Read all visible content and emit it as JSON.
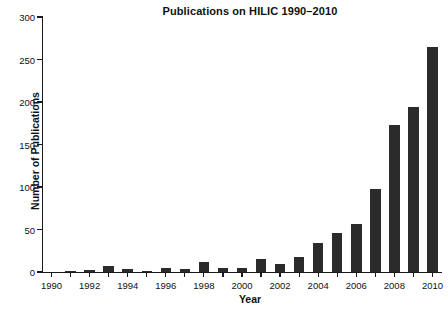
{
  "chart_data": {
    "type": "bar",
    "title": "Publications on HILIC 1990–2010",
    "xlabel": "Year",
    "ylabel": "Number of Publications",
    "categories": [
      "1990",
      "1991",
      "1992",
      "1993",
      "1994",
      "1995",
      "1996",
      "1997",
      "1998",
      "1999",
      "2000",
      "2001",
      "2002",
      "2003",
      "2004",
      "2005",
      "2006",
      "2007",
      "2008",
      "2009",
      "2010"
    ],
    "values": [
      0,
      1,
      2,
      7,
      4,
      1,
      5,
      4,
      12,
      5,
      5,
      15,
      9,
      18,
      34,
      46,
      57,
      98,
      173,
      194,
      265
    ],
    "xlim": [
      1989.5,
      2010.5
    ],
    "ylim": [
      0,
      300
    ],
    "ytick_values": [
      0,
      50,
      100,
      150,
      200,
      250,
      300
    ],
    "ytick_labels": [
      "0",
      "50",
      "100",
      "150",
      "200",
      "250",
      "300"
    ],
    "xtick_labels_visible": [
      "1990",
      "1992",
      "1994",
      "1996",
      "1998",
      "2000",
      "2002",
      "2004",
      "2006",
      "2008",
      "2010"
    ],
    "grid": false,
    "legend": null,
    "bar_color": "#2b2b2b",
    "axis_color": "#1a1a1a",
    "background_color": "#ffffff"
  }
}
